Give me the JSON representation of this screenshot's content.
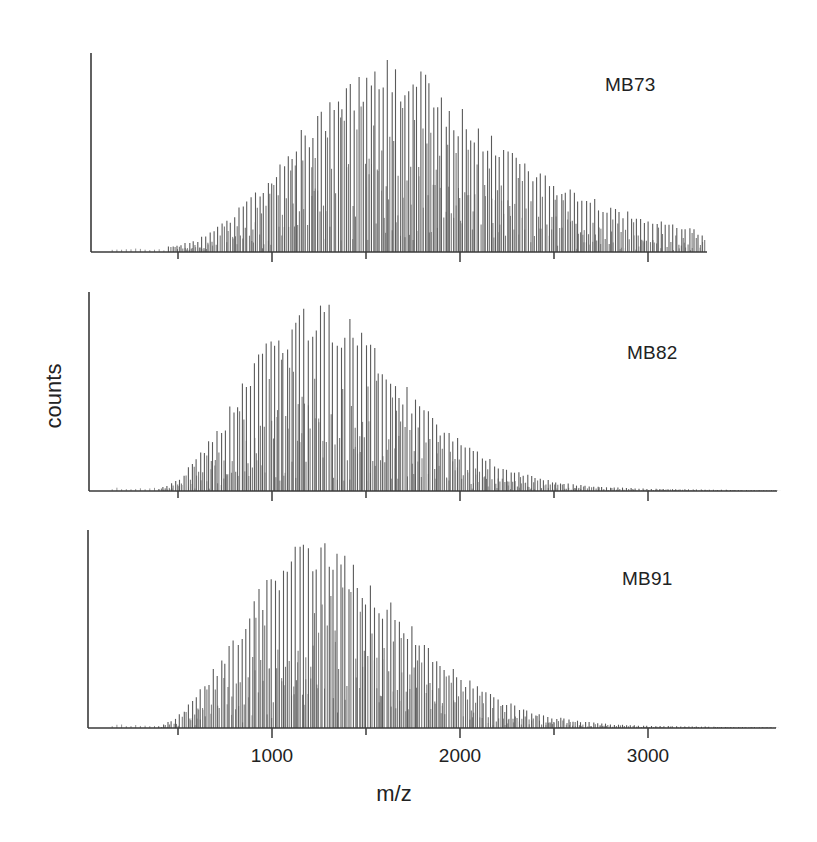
{
  "chart_data": {
    "type": "bar",
    "subtype": "mass-spectrum (stick spectra)",
    "xlabel": "m/z",
    "ylabel": "counts",
    "x_ticks": [
      500,
      1000,
      1500,
      2000,
      2500,
      3000
    ],
    "x_tick_labels": [
      "1000",
      "2000",
      "3000"
    ],
    "x_tick_label_values": [
      1000,
      2000,
      3000
    ],
    "xlim": [
      20,
      3690
    ],
    "grid": false,
    "legend": "none (per-panel text labels)",
    "panels": [
      {
        "name": "MB73",
        "label": "MB73",
        "envelope_peak_mz": 1600,
        "mz_start": 450,
        "mz_end": 3300,
        "peak_spacing_mz": 22,
        "envelope": {
          "mz": [
            450,
            600,
            800,
            1000,
            1200,
            1400,
            1600,
            1800,
            2000,
            2200,
            2400,
            2600,
            2800,
            3000,
            3200,
            3300
          ],
          "relative": [
            0.03,
            0.06,
            0.2,
            0.42,
            0.68,
            0.9,
            1.0,
            0.92,
            0.74,
            0.56,
            0.42,
            0.32,
            0.24,
            0.18,
            0.13,
            0.1
          ]
        }
      },
      {
        "name": "MB82",
        "label": "MB82",
        "envelope_peak_mz": 1250,
        "mz_start": 400,
        "mz_end": 3690,
        "peak_spacing_mz": 22,
        "envelope": {
          "mz": [
            400,
            500,
            700,
            900,
            1100,
            1250,
            1400,
            1600,
            1800,
            2000,
            2200,
            2400,
            2600,
            2800,
            3000,
            3400,
            3690
          ],
          "relative": [
            0.01,
            0.06,
            0.3,
            0.66,
            0.94,
            1.0,
            0.9,
            0.66,
            0.44,
            0.26,
            0.14,
            0.07,
            0.035,
            0.02,
            0.012,
            0.006,
            0.004
          ]
        }
      },
      {
        "name": "MB91",
        "label": "MB91",
        "envelope_peak_mz": 1220,
        "mz_start": 400,
        "mz_end": 3680,
        "peak_spacing_mz": 22,
        "envelope": {
          "mz": [
            400,
            500,
            700,
            900,
            1100,
            1220,
            1400,
            1600,
            1800,
            2000,
            2200,
            2400,
            2600,
            2800,
            3000,
            3400,
            3680
          ],
          "relative": [
            0.01,
            0.06,
            0.32,
            0.68,
            0.95,
            1.0,
            0.9,
            0.68,
            0.46,
            0.28,
            0.15,
            0.08,
            0.04,
            0.02,
            0.012,
            0.006,
            0.004
          ]
        }
      }
    ]
  },
  "layout": {
    "px_per_mz": 0.188,
    "x_origin_px": 84,
    "panels": [
      {
        "axis_x": 91,
        "top": 53,
        "baseline": 252,
        "right_end": 707,
        "label_x": 605,
        "label_y": 74
      },
      {
        "axis_x": 89,
        "top": 292,
        "baseline": 491,
        "right_end": 777,
        "label_x": 627,
        "label_y": 342
      },
      {
        "axis_x": 88,
        "top": 530,
        "baseline": 728,
        "right_end": 776,
        "label_x": 622,
        "label_y": 568
      }
    ]
  },
  "style": {
    "axis_color": "#3a3a3a",
    "stick_color": "#7a7a7a",
    "stick_color_dark": "#5a5a5a"
  }
}
